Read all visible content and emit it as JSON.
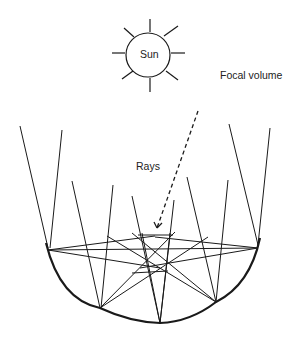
{
  "diagram": {
    "type": "solar concentrator ray diagram",
    "labels": {
      "sun": "Sun",
      "focal_volume": "Focal volume",
      "rays": "Rays"
    },
    "colors": {
      "stroke": "#1a1a1a",
      "background": "#ffffff"
    }
  }
}
